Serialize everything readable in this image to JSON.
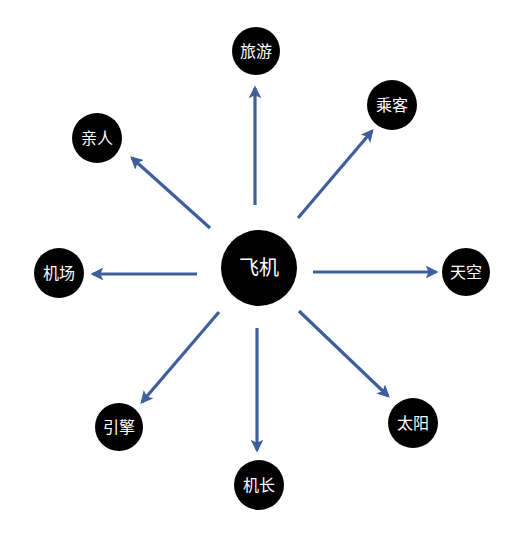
{
  "diagram": {
    "type": "radial-mind-map",
    "arrow_color": "#3e5f9b",
    "node_color": "#000000",
    "text_color": "#ffffff",
    "center": {
      "label": "飞机",
      "x": 259,
      "y": 268,
      "r": 38,
      "font_size": 20
    },
    "nodes": [
      {
        "id": "travel",
        "label": "旅游",
        "x": 256,
        "y": 51,
        "r": 24,
        "font_size": 16
      },
      {
        "id": "passenger",
        "label": "乘客",
        "x": 392,
        "y": 105,
        "r": 25,
        "font_size": 16
      },
      {
        "id": "sky",
        "label": "天空",
        "x": 466,
        "y": 272,
        "r": 24,
        "font_size": 16
      },
      {
        "id": "sun",
        "label": "太阳",
        "x": 413,
        "y": 423,
        "r": 25,
        "font_size": 16
      },
      {
        "id": "captain",
        "label": "机长",
        "x": 259,
        "y": 485,
        "r": 25,
        "font_size": 16
      },
      {
        "id": "engine",
        "label": "引擎",
        "x": 119,
        "y": 427,
        "r": 24,
        "font_size": 16
      },
      {
        "id": "airport",
        "label": "机场",
        "x": 59,
        "y": 273,
        "r": 25,
        "font_size": 16
      },
      {
        "id": "family",
        "label": "亲人",
        "x": 97,
        "y": 138,
        "r": 25,
        "font_size": 16
      }
    ],
    "edges": [
      {
        "to": "travel",
        "x1": 255,
        "y1": 205,
        "x2": 255,
        "y2": 88
      },
      {
        "to": "passenger",
        "x1": 298,
        "y1": 218,
        "x2": 372,
        "y2": 131
      },
      {
        "to": "sky",
        "x1": 313,
        "y1": 272,
        "x2": 436,
        "y2": 272
      },
      {
        "to": "sun",
        "x1": 299,
        "y1": 311,
        "x2": 388,
        "y2": 396
      },
      {
        "to": "captain",
        "x1": 257,
        "y1": 328,
        "x2": 257,
        "y2": 450
      },
      {
        "to": "engine",
        "x1": 219,
        "y1": 312,
        "x2": 142,
        "y2": 402
      },
      {
        "to": "airport",
        "x1": 197,
        "y1": 274,
        "x2": 93,
        "y2": 274
      },
      {
        "to": "family",
        "x1": 210,
        "y1": 228,
        "x2": 132,
        "y2": 158
      }
    ]
  }
}
